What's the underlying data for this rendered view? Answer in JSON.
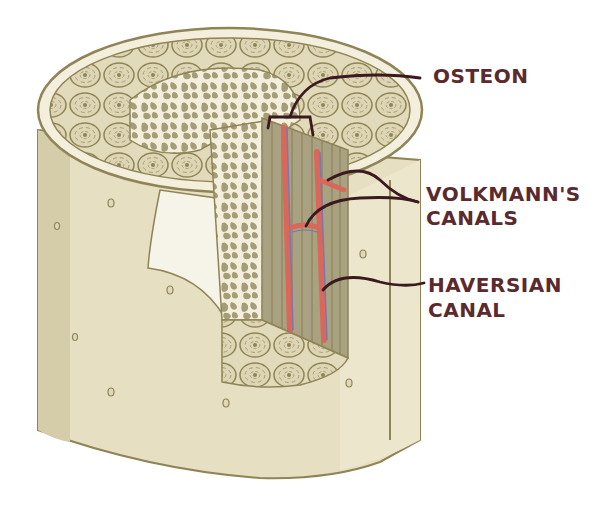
{
  "diagram": {
    "colors": {
      "bone_outer": "#e6dfc1",
      "bone_shadow": "#d5ccaa",
      "outline": "#8f8457",
      "osteon_fill": "#ddd5b4",
      "spongy": "#a59c78",
      "cut_face": "#a8a282",
      "vessel_artery": "#d9685a",
      "vessel_vein": "#7a78b0",
      "leader_line": "#3a1a1e",
      "label_text": "#5a2a2e"
    },
    "labels": {
      "osteon": "OSTEON",
      "volkmanns_line1": "VOLKMANN'S",
      "volkmanns_line2": "CANALS",
      "haversian_line1": "HAVERSIAN",
      "haversian_line2": "CANAL"
    }
  }
}
